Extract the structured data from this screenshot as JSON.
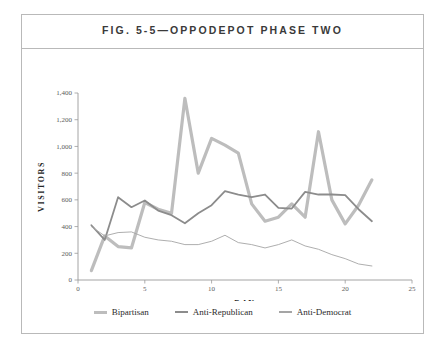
{
  "figure": {
    "title": "FIG. 5-5—OPPODEPOT PHASE TWO"
  },
  "legend": {
    "items": [
      {
        "label": "Bipartisan",
        "color": "#bdbdbd"
      },
      {
        "label": "Anti-Republican",
        "color": "#8c8c8c"
      },
      {
        "label": "Anti-Democrat",
        "color": "#a5a5a5"
      }
    ]
  },
  "chart_data": {
    "type": "line",
    "title": "FIG. 5-5—OPPODEPOT PHASE TWO",
    "xlabel": "DAY",
    "ylabel": "VISITORS",
    "xlim": [
      0,
      25
    ],
    "ylim": [
      0,
      1400
    ],
    "xticks": [
      0,
      5,
      10,
      15,
      20,
      25
    ],
    "xtick_labels": [
      "0",
      "5",
      "10",
      "15",
      "20",
      "25"
    ],
    "yticks": [
      0,
      200,
      400,
      600,
      800,
      1000,
      1200,
      1400
    ],
    "ytick_labels": [
      "0",
      "200",
      "400",
      "600",
      "800",
      "1,000",
      "1,200",
      "1,400"
    ],
    "grid": false,
    "legend_position": "bottom",
    "x": [
      1,
      2,
      3,
      4,
      5,
      6,
      7,
      8,
      9,
      10,
      11,
      12,
      13,
      14,
      15,
      16,
      17,
      18,
      19,
      20,
      21,
      22
    ],
    "series": [
      {
        "name": "Bipartisan",
        "color": "#bdbdbd",
        "width": 3.2,
        "values": [
          70,
          330,
          250,
          240,
          580,
          530,
          500,
          1360,
          800,
          1060,
          1010,
          950,
          570,
          440,
          470,
          570,
          470,
          1110,
          600,
          420,
          560,
          750
        ]
      },
      {
        "name": "Anti-Republican",
        "color": "#8c8c8c",
        "width": 1.8,
        "values": [
          410,
          300,
          620,
          545,
          595,
          520,
          485,
          425,
          500,
          560,
          665,
          640,
          620,
          640,
          540,
          535,
          660,
          640,
          640,
          635,
          530,
          440
        ]
      },
      {
        "name": "Anti-Democrat",
        "color": "#a5a5a5",
        "width": 0.9,
        "values": [
          400,
          330,
          355,
          360,
          320,
          300,
          290,
          265,
          265,
          290,
          335,
          280,
          265,
          240,
          265,
          300,
          255,
          230,
          190,
          160,
          120,
          105
        ]
      }
    ]
  }
}
